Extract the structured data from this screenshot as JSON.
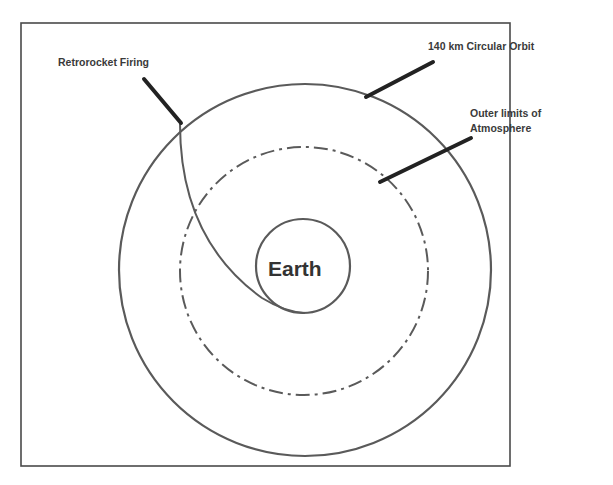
{
  "diagram": {
    "labels": {
      "retrorocket": "Retrorocket Firing",
      "orbit": "140 km Circular Orbit",
      "atmosphere_line1": "Outer limits of",
      "atmosphere_line2": "Atmosphere",
      "earth": "Earth"
    },
    "elements": [
      {
        "id": "frame",
        "kind": "rectangle-border"
      },
      {
        "id": "orbit",
        "kind": "circle",
        "style": "solid",
        "represents": "140 km Circular Orbit"
      },
      {
        "id": "atmosphere",
        "kind": "circle",
        "style": "dash-dot",
        "represents": "Outer limits of Atmosphere"
      },
      {
        "id": "earth",
        "kind": "circle",
        "style": "solid",
        "represents": "Earth"
      },
      {
        "id": "trajectory",
        "kind": "curve",
        "from": "retrorocket firing point on orbit",
        "to": "Earth surface"
      },
      {
        "id": "leader-retrorocket",
        "kind": "leader-line"
      },
      {
        "id": "leader-orbit",
        "kind": "leader-line"
      },
      {
        "id": "leader-atmosphere",
        "kind": "leader-line"
      }
    ],
    "colors": {
      "stroke": "#5a5a5a",
      "leader": "#222222",
      "text": "#3a3a3a",
      "background": "#ffffff"
    }
  }
}
